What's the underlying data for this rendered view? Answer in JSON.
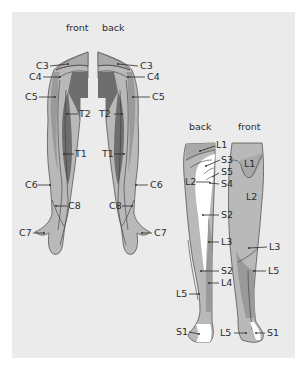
{
  "arms": {
    "front_label": "front",
    "back_label": "back",
    "front_labels": [
      "C3",
      "C4",
      "C5",
      "T2",
      "T1",
      "C6",
      "C8",
      "C7"
    ],
    "back_labels": [
      "C3",
      "C4",
      "C5",
      "T2",
      "T1",
      "C6",
      "C8",
      "C7"
    ]
  },
  "legs": {
    "back_label": "back",
    "front_label": "front",
    "back_labels": [
      "L1",
      "S3",
      "S5",
      "S4",
      "L2",
      "S2",
      "L3",
      "S2",
      "L4",
      "L5",
      "S1"
    ],
    "front_labels": [
      "L1",
      "L2",
      "L3",
      "L5",
      "L5",
      "S1"
    ]
  },
  "colors": {
    "background": "#ebebeb",
    "light_gray": "#b9b9b9",
    "mid_gray": "#9a9a9a",
    "dark_gray": "#6e6e6e",
    "white_zone": "#ffffff",
    "text": "#2b2b2b"
  }
}
